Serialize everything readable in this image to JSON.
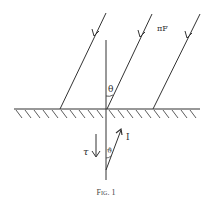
{
  "figure": {
    "caption": "Fig. 1",
    "labels": {
      "incident_flux": "πF",
      "zenith_angle": "θ",
      "direction_angle": "ϑ",
      "downward_intensity": "τ",
      "intensity": "I"
    },
    "colors": {
      "ink": "#333333",
      "background": "#ffffff"
    }
  }
}
